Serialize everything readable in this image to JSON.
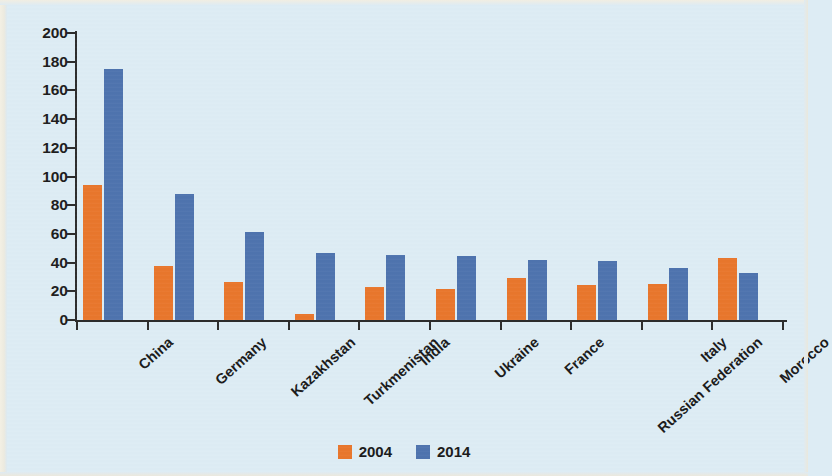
{
  "chart_data": {
    "type": "bar",
    "title": "",
    "subtitle": "",
    "xlabel": "",
    "ylabel": "Thousands",
    "ylim": [
      0,
      200
    ],
    "ytick_step": 20,
    "yticks": [
      200,
      180,
      160,
      140,
      120,
      100,
      80,
      60,
      40,
      20,
      0
    ],
    "grid": false,
    "legend_position": "bottom-center",
    "categories": [
      "China",
      "Germany",
      "Kazakhstan",
      "Turkmenistan",
      "India",
      "Ukraine",
      "France",
      "Russian Federation",
      "Italy",
      "Morocco"
    ],
    "series": [
      {
        "name": "2004",
        "color": "#e8762c",
        "values": [
          94,
          37.5,
          26.5,
          4,
          23,
          21.5,
          29.5,
          24.5,
          25,
          43
        ]
      },
      {
        "name": "2014",
        "color": "#4e73ae",
        "values": [
          175,
          88,
          61,
          47,
          45.5,
          44.5,
          42,
          41,
          36,
          33
        ]
      }
    ]
  },
  "legend": {
    "items": [
      {
        "label": "2004",
        "color": "#e8762c"
      },
      {
        "label": "2014",
        "color": "#4e73ae"
      }
    ]
  },
  "colors": {
    "background": "#ddecf4",
    "axis": "#2c2c2c",
    "text": "#1a1a1a",
    "series_2004": "#e8762c",
    "series_2014": "#4e73ae"
  }
}
